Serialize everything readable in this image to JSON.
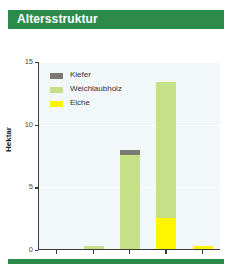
{
  "header": {
    "title": "Altersstruktur",
    "bar_color": "#2c8b4b"
  },
  "footer": {
    "bar_color": "#2c8b4b"
  },
  "chart_data": {
    "type": "bar",
    "stacked": true,
    "title": "Altersstruktur",
    "xlabel": "Alter in Jahren",
    "ylabel": "Hektar",
    "categories": [
      "1–20",
      "21–40",
      "41–60",
      "61–80",
      "81–100"
    ],
    "ylim": [
      0,
      15
    ],
    "yticks": [
      0,
      5,
      10,
      15
    ],
    "ytick_labels": [
      "0",
      "5",
      "10",
      "15"
    ],
    "grid": true,
    "legend_position": "top-left-inside",
    "series": [
      {
        "name": "Kiefer",
        "color": "#7a7a72",
        "values": [
          0,
          0,
          0.4,
          0,
          0
        ]
      },
      {
        "name": "Weichlaubholz",
        "color": "#c5e086",
        "values": [
          0,
          0.25,
          7.5,
          10.8,
          0
        ]
      },
      {
        "name": "Eiche",
        "color": "#fff500",
        "values": [
          0,
          0,
          0,
          2.5,
          0.25
        ]
      }
    ],
    "totals": [
      0,
      0.25,
      7.9,
      13.3,
      0.25
    ]
  },
  "colors": {
    "plot_background": "#f2f7fa",
    "axis": "#3a3a3a",
    "gridline": "#ffffff",
    "page_background": "#ffffff"
  }
}
